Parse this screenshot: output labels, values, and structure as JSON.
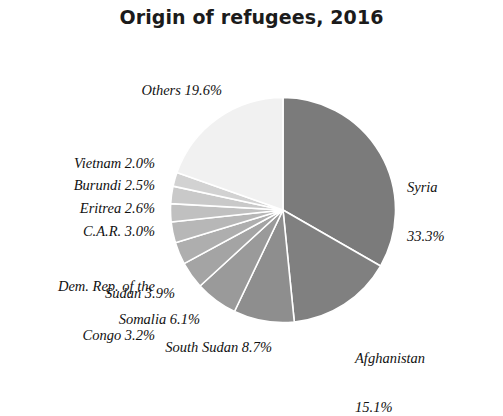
{
  "title": "Origin of refugees, 2016",
  "background_color": "#ffffff",
  "chart_data": {
    "type": "pie",
    "title": "Origin of refugees, 2016",
    "xlabel": "",
    "ylabel": "",
    "units": "percent",
    "start_angle_deg": 0,
    "direction": "clockwise",
    "legend": "none (direct slice labels)",
    "grid": false,
    "categories": [
      "Syria",
      "Afghanistan",
      "South Sudan",
      "Somalia",
      "Sudan",
      "Dem. Rep. of the Congo",
      "C.A.R.",
      "Eritrea",
      "Burundi",
      "Vietnam",
      "Others"
    ],
    "values": [
      33.3,
      15.1,
      8.7,
      6.1,
      3.9,
      3.2,
      3.0,
      2.6,
      2.5,
      2.0,
      19.6
    ],
    "colors": [
      "#7b7b7b",
      "#808080",
      "#8e8e8e",
      "#9a9a9a",
      "#a4a4a4",
      "#aeaeae",
      "#b7b7b7",
      "#c0c0c0",
      "#c9c9c9",
      "#d2d2d2",
      "#f1f1f1"
    ],
    "slice_border_color": "#ffffff",
    "slices": [
      {
        "label": "Syria",
        "value": 33.3,
        "display": "33.3%",
        "color": "#7b7b7b"
      },
      {
        "label": "Afghanistan",
        "value": 15.1,
        "display": "15.1%",
        "color": "#808080"
      },
      {
        "label": "South Sudan",
        "value": 8.7,
        "display": "8.7%",
        "color": "#8e8e8e"
      },
      {
        "label": "Somalia",
        "value": 6.1,
        "display": "6.1%",
        "color": "#9a9a9a"
      },
      {
        "label": "Sudan",
        "value": 3.9,
        "display": "3.9%",
        "color": "#a4a4a4"
      },
      {
        "label": "Dem. Rep. of the Congo",
        "value": 3.2,
        "display": "3.2%",
        "color": "#aeaeae"
      },
      {
        "label": "C.A.R.",
        "value": 3.0,
        "display": "3.0%",
        "color": "#b7b7b7"
      },
      {
        "label": "Eritrea",
        "value": 2.6,
        "display": "2.6%",
        "color": "#c0c0c0"
      },
      {
        "label": "Burundi",
        "value": 2.5,
        "display": "2.5%",
        "color": "#c9c9c9"
      },
      {
        "label": "Vietnam",
        "value": 2.0,
        "display": "2.0%",
        "color": "#d2d2d2"
      },
      {
        "label": "Others",
        "value": 19.6,
        "display": "19.6%",
        "color": "#f1f1f1"
      }
    ]
  },
  "labels": {
    "others": "Others 19.6%",
    "vietnam": "Vietnam 2.0%",
    "burundi": "Burundi 2.5%",
    "eritrea": "Eritrea 2.6%",
    "car": "C.A.R. 3.0%",
    "drc_line1": "Dem. Rep. of the",
    "drc_line2": "Congo 3.2%",
    "sudan": "Sudan 3.9%",
    "somalia": "Somalia 6.1%",
    "south_sudan": "South Sudan 8.7%",
    "syria_line1": "Syria",
    "syria_line2": "33.3%",
    "afghanistan_line1": "Afghanistan",
    "afghanistan_line2": "15.1%"
  }
}
